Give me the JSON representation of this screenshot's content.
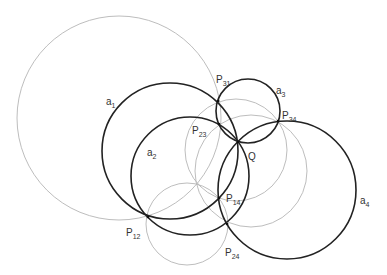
{
  "diagram": {
    "width": 387,
    "height": 275,
    "colors": {
      "thick": "#222222",
      "thin": "#b5b5b5",
      "text": "#333333",
      "point": "#111111"
    },
    "thick_circles": [
      {
        "id": "a1",
        "cx": 170,
        "cy": 151,
        "r": 68
      },
      {
        "id": "a2",
        "cx": 190,
        "cy": 176,
        "r": 59
      },
      {
        "id": "a3",
        "cx": 248,
        "cy": 111,
        "r": 32
      },
      {
        "id": "a4",
        "cx": 287,
        "cy": 190,
        "r": 69
      }
    ],
    "thin_circles": [
      {
        "id": "c-big",
        "cx": 119,
        "cy": 118,
        "r": 102
      },
      {
        "id": "c-mid1",
        "cx": 236,
        "cy": 150,
        "r": 51
      },
      {
        "id": "c-mid2",
        "cx": 251,
        "cy": 171,
        "r": 56
      },
      {
        "id": "c-small",
        "cx": 187,
        "cy": 224,
        "r": 41
      }
    ],
    "points": [
      {
        "id": "P31",
        "x": 218,
        "y": 101
      },
      {
        "id": "P23",
        "x": 219,
        "y": 124
      },
      {
        "id": "Q",
        "x": 238,
        "y": 142
      },
      {
        "id": "P34",
        "x": 278,
        "y": 121
      },
      {
        "id": "P14",
        "x": 219,
        "y": 198
      },
      {
        "id": "P24",
        "x": 227,
        "y": 224
      },
      {
        "id": "P12",
        "x": 148,
        "y": 217
      }
    ],
    "labels": [
      {
        "id": "a1",
        "main": "a",
        "sub": "1",
        "x": 106,
        "y": 105
      },
      {
        "id": "a2",
        "main": "a",
        "sub": "2",
        "x": 147,
        "y": 156
      },
      {
        "id": "a3",
        "main": "a",
        "sub": "3",
        "x": 276,
        "y": 94
      },
      {
        "id": "a4",
        "main": "a",
        "sub": "4",
        "x": 360,
        "y": 204
      },
      {
        "id": "P31",
        "main": "P",
        "sub": "31",
        "x": 216,
        "y": 83
      },
      {
        "id": "P34",
        "main": "P",
        "sub": "34",
        "x": 282,
        "y": 119
      },
      {
        "id": "P23",
        "main": "P",
        "sub": "23",
        "x": 192,
        "y": 134
      },
      {
        "id": "Q",
        "main": "Q",
        "sub": "",
        "x": 248,
        "y": 160
      },
      {
        "id": "P14",
        "main": "P",
        "sub": "14",
        "x": 226,
        "y": 202
      },
      {
        "id": "P12",
        "main": "P",
        "sub": "12",
        "x": 126,
        "y": 236
      },
      {
        "id": "P24",
        "main": "P",
        "sub": "24",
        "x": 225,
        "y": 256
      }
    ]
  }
}
